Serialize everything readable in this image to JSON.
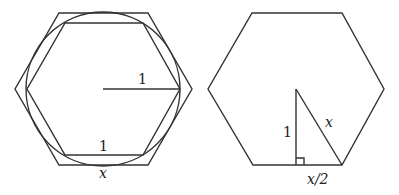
{
  "left_figure": {
    "description": "Circle of radius 1 between inscribed and circumscribed regular hexagons",
    "radius_label": "1",
    "inner_side_label": "1",
    "outer_side_label": "x"
  },
  "right_figure": {
    "description": "Circumscribed hexagon with right triangle from center to side",
    "height_label": "1",
    "hypotenuse_label": "x",
    "half_side_label": "x/2"
  }
}
